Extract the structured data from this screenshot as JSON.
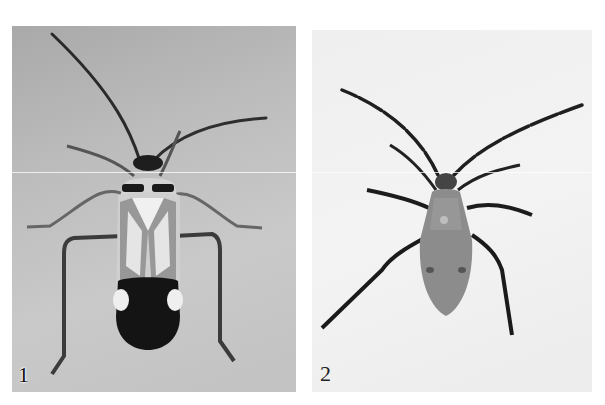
{
  "figure": {
    "panels": [
      {
        "label": "1",
        "subject": "adult plant bug, dorsal view",
        "background": "#bdbdbd"
      },
      {
        "label": "2",
        "subject": "nymph, dorsal view",
        "background": "#f0f0f0"
      }
    ]
  }
}
